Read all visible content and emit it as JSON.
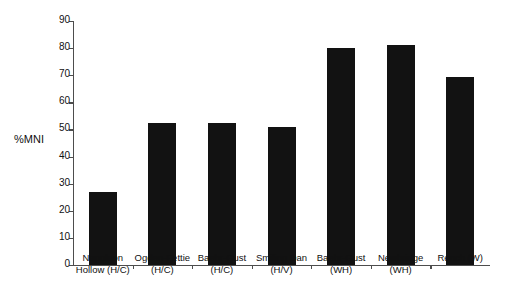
{
  "chart_data": {
    "type": "bar",
    "title": "",
    "subtitle": "",
    "xlabel": "",
    "ylabel": "%MNI",
    "ylim": [
      0,
      90
    ],
    "ytick_step": 10,
    "grid": false,
    "legend": "none",
    "bar_color": "#121212",
    "axis_color": "#4d4d4d",
    "yticks": [
      "90",
      "80",
      "70",
      "60",
      "50",
      "40",
      "30",
      "20",
      "10",
      "0"
    ],
    "ytick_values": [
      90,
      80,
      70,
      60,
      50,
      40,
      30,
      20,
      10,
      0
    ],
    "categories": [
      "Napoleon Hollow (H/C)",
      "Ogden-Fettie (H/C)",
      "Baehr-Gust (H/C)",
      "Smiling Dan (H/V)",
      "Baehr-Gust (WH)",
      "Newbridge (WH)",
      "Rench (W)"
    ],
    "category_lines": [
      [
        "Napoleon",
        "Hollow (H/C)"
      ],
      [
        "Ogden-Fettie",
        "(H/C)"
      ],
      [
        "Baehr-Gust",
        "(H/C)"
      ],
      [
        "Smiling Dan",
        "(H/V)"
      ],
      [
        "Baehr-Gust",
        "(WH)"
      ],
      [
        "Newbridge",
        "(WH)"
      ],
      [
        "Rench (W)",
        ""
      ]
    ],
    "values": [
      27,
      52.5,
      52.5,
      51,
      80,
      81,
      69.5
    ]
  }
}
